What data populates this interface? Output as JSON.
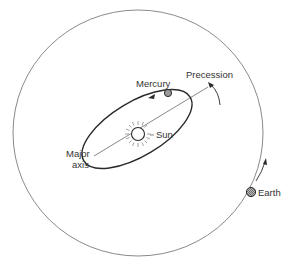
{
  "diagram": {
    "labels": {
      "mercury": "Mercury",
      "precession": "Precession",
      "sun": "Sun",
      "major_axis_line1": "Major",
      "major_axis_line2": "axis",
      "earth": "Earth"
    },
    "colors": {
      "background": "#ffffff",
      "orbit_line": "#8a8a8a",
      "ellipse_line": "#2a2a2a",
      "planet_fill": "#9a9a9a",
      "text": "#333333"
    },
    "elements": [
      {
        "name": "earth-orbit",
        "shape": "circle"
      },
      {
        "name": "mercury-orbit",
        "shape": "ellipse"
      },
      {
        "name": "sun",
        "shape": "circle-with-rays"
      },
      {
        "name": "mercury",
        "shape": "small-circle"
      },
      {
        "name": "earth",
        "shape": "small-circle"
      },
      {
        "name": "major-axis",
        "shape": "line"
      },
      {
        "name": "precession-arrow",
        "shape": "curved-arrow"
      },
      {
        "name": "earth-motion-arrow",
        "shape": "curved-arrow"
      },
      {
        "name": "mercury-direction-arrow",
        "shape": "arrowhead"
      }
    ]
  }
}
